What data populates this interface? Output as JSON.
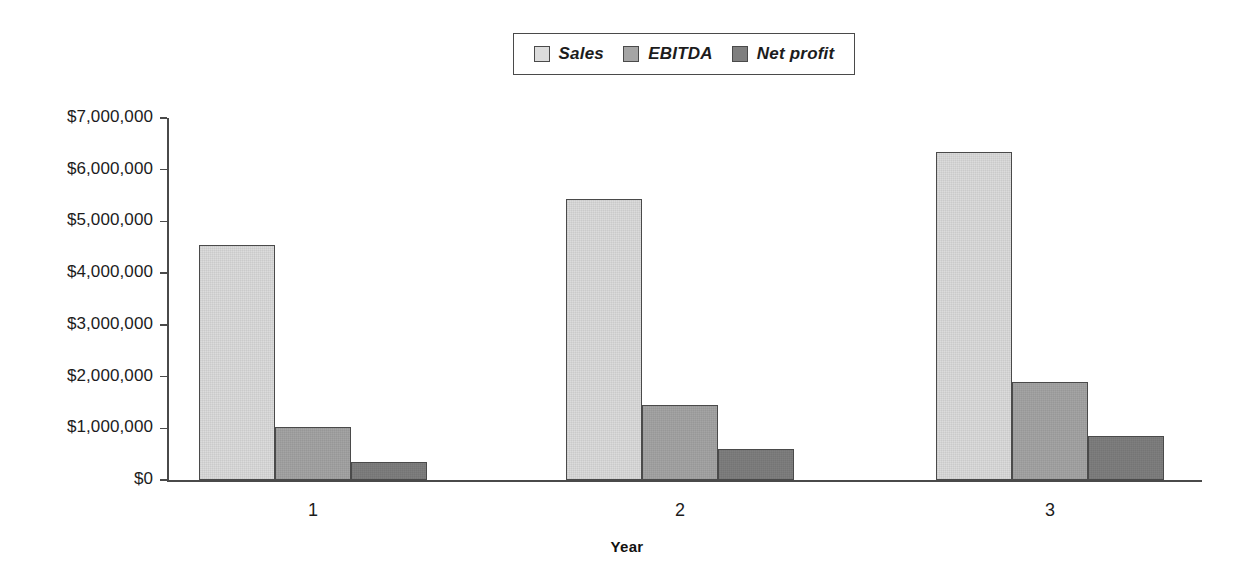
{
  "chart_data": {
    "type": "bar",
    "title": "",
    "xlabel": "Year",
    "ylabel": "",
    "categories": [
      "1",
      "2",
      "3"
    ],
    "series": [
      {
        "name": "Sales",
        "values": [
          4550000,
          5440000,
          6350000
        ],
        "color": "#dcdcdc"
      },
      {
        "name": "EBITDA",
        "values": [
          1030000,
          1450000,
          1890000
        ],
        "color": "#a5a5a5"
      },
      {
        "name": "Net profit",
        "values": [
          340000,
          600000,
          860000
        ],
        "color": "#7f7f7f"
      }
    ],
    "ylim": [
      0,
      7000000
    ],
    "ytick_values": [
      0,
      1000000,
      2000000,
      3000000,
      4000000,
      5000000,
      6000000,
      7000000
    ],
    "ytick_labels": [
      "$0",
      "$1,000,000",
      "$2,000,000",
      "$3,000,000",
      "$4,000,000",
      "$5,000,000",
      "$6,000,000",
      "$7,000,000"
    ],
    "grid": false,
    "legend_position": "top-center"
  },
  "legend": {
    "entries": [
      {
        "label": "Sales"
      },
      {
        "label": "EBITDA"
      },
      {
        "label": "Net profit"
      }
    ]
  },
  "axes": {
    "x_title": "Year",
    "x_labels": [
      "1",
      "2",
      "3"
    ],
    "y_labels": [
      "$7,000,000",
      "$6,000,000",
      "$5,000,000",
      "$4,000,000",
      "$3,000,000",
      "$2,000,000",
      "$1,000,000",
      "$0"
    ]
  },
  "colors": {
    "sales": "#dcdcdc",
    "ebitda": "#a5a5a5",
    "net_profit": "#7f7f7f",
    "axis": "#4a4a4a",
    "text": "#1c1c1c",
    "background": "#ffffff"
  }
}
